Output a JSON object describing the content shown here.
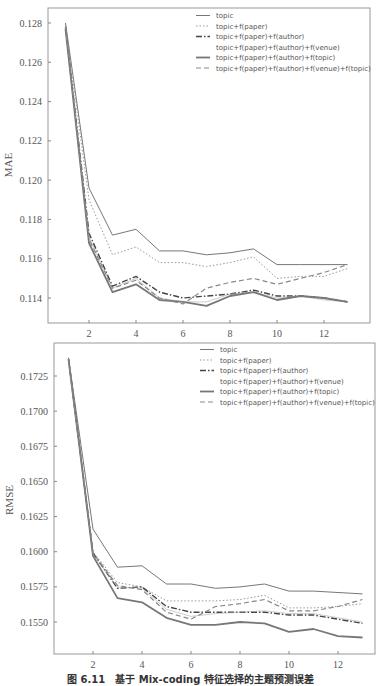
{
  "caption": "图 6.11　基于 Mix-coding 特征选择的主题预测误差",
  "chart_data": [
    {
      "type": "line",
      "title": "",
      "xlabel": "",
      "ylabel": "MAE",
      "x": [
        1,
        2,
        3,
        4,
        5,
        6,
        7,
        8,
        9,
        10,
        11,
        12,
        13
      ],
      "xticks": [
        2,
        4,
        6,
        8,
        10,
        12
      ],
      "yticks": [
        0.114,
        0.116,
        0.118,
        0.12,
        0.122,
        0.124,
        0.126,
        0.128
      ],
      "ytick_labels": [
        "0.114",
        "0.116",
        "0.118",
        "0.120",
        "0.122",
        "0.124",
        "0.126",
        "0.128"
      ],
      "xlim": [
        0.5,
        13.5
      ],
      "ylim": [
        0.1128,
        0.1285
      ],
      "grid": false,
      "legend_position": "upper right",
      "series": [
        {
          "name": "topic",
          "style": "solid",
          "width": 1,
          "values": [
            0.128,
            0.1196,
            0.1172,
            0.1175,
            0.1164,
            0.1164,
            0.1162,
            0.1163,
            0.1165,
            0.1157,
            0.1157,
            0.1157,
            0.1157
          ]
        },
        {
          "name": "topic+f(paper)",
          "style": "dotted",
          "width": 1,
          "values": [
            0.1279,
            0.119,
            0.1162,
            0.1166,
            0.1158,
            0.1158,
            0.1156,
            0.1158,
            0.1161,
            0.115,
            0.1151,
            0.1151,
            0.1155
          ]
        },
        {
          "name": "topic+f(paper)+f(author)",
          "style": "dashdot",
          "width": 1.4,
          "values": [
            0.1278,
            0.1173,
            0.1146,
            0.1151,
            0.1143,
            0.114,
            0.1141,
            0.1142,
            0.1144,
            0.1141,
            0.1141,
            0.114,
            0.1138
          ]
        },
        {
          "name": "topic+f(paper)+f(author)+f(venue)",
          "style": "none",
          "width": 1,
          "values": [
            0.1278,
            0.1171,
            0.1145,
            0.115,
            0.114,
            0.1138,
            0.1138,
            0.1142,
            0.1143,
            0.114,
            0.1141,
            0.1139,
            0.1138
          ]
        },
        {
          "name": "topic+f(paper)+f(author)+f(topic)",
          "style": "solid",
          "width": 1.8,
          "values": [
            0.1277,
            0.1168,
            0.1143,
            0.1147,
            0.1139,
            0.1138,
            0.1136,
            0.1141,
            0.1143,
            0.1139,
            0.1141,
            0.114,
            0.1138
          ]
        },
        {
          "name": "topic+f(paper)+f(author)+f(venue)+f(topic)",
          "style": "dashed",
          "width": 1.2,
          "values": [
            0.1278,
            0.117,
            0.1145,
            0.1149,
            0.114,
            0.1137,
            0.1145,
            0.1148,
            0.115,
            0.1147,
            0.115,
            0.1153,
            0.1157
          ]
        }
      ]
    },
    {
      "type": "line",
      "title": "",
      "xlabel": "",
      "ylabel": "RMSE",
      "x": [
        1,
        2,
        3,
        4,
        5,
        6,
        7,
        8,
        9,
        10,
        11,
        12,
        13
      ],
      "xticks": [
        2,
        4,
        6,
        8,
        10,
        12
      ],
      "yticks": [
        0.155,
        0.1575,
        0.16,
        0.1625,
        0.165,
        0.1675,
        0.17,
        0.1725
      ],
      "ytick_labels": [
        "0.1550",
        "0.1575",
        "0.1600",
        "0.1625",
        "0.1650",
        "0.1675",
        "0.1700",
        "0.1725"
      ],
      "xlim": [
        0.5,
        13.5
      ],
      "ylim": [
        0.1528,
        0.1748
      ],
      "grid": false,
      "legend_position": "upper right",
      "series": [
        {
          "name": "topic",
          "style": "solid",
          "width": 1,
          "values": [
            0.1738,
            0.1616,
            0.1589,
            0.159,
            0.1577,
            0.1577,
            0.1574,
            0.1575,
            0.1577,
            0.1572,
            0.1572,
            0.1571,
            0.157
          ]
        },
        {
          "name": "topic+f(paper)",
          "style": "dotted",
          "width": 1,
          "values": [
            0.1737,
            0.16,
            0.1578,
            0.1575,
            0.1565,
            0.1565,
            0.1565,
            0.1566,
            0.1569,
            0.156,
            0.156,
            0.1561,
            0.1563
          ]
        },
        {
          "name": "topic+f(paper)+f(author)",
          "style": "dashdot",
          "width": 1.4,
          "values": [
            0.1737,
            0.1599,
            0.1574,
            0.1575,
            0.1561,
            0.1557,
            0.1557,
            0.1557,
            0.1557,
            0.1555,
            0.1555,
            0.1552,
            0.1549
          ]
        },
        {
          "name": "topic+f(paper)+f(author)+f(venue)",
          "style": "none",
          "width": 1,
          "values": [
            0.1737,
            0.1598,
            0.1575,
            0.1574,
            0.1559,
            0.1554,
            0.1556,
            0.1557,
            0.1558,
            0.1556,
            0.1556,
            0.1553,
            0.155
          ]
        },
        {
          "name": "topic+f(paper)+f(author)+f(topic)",
          "style": "solid",
          "width": 1.8,
          "values": [
            0.1737,
            0.1597,
            0.1567,
            0.1564,
            0.1553,
            0.1548,
            0.1548,
            0.155,
            0.1549,
            0.1543,
            0.1545,
            0.154,
            0.1539
          ]
        },
        {
          "name": "topic+f(paper)+f(author)+f(venue)+f(topic)",
          "style": "dashed",
          "width": 1.2,
          "values": [
            0.1737,
            0.1599,
            0.1576,
            0.1573,
            0.1557,
            0.1552,
            0.1561,
            0.1563,
            0.1566,
            0.1558,
            0.1558,
            0.1561,
            0.1566
          ]
        }
      ]
    }
  ]
}
